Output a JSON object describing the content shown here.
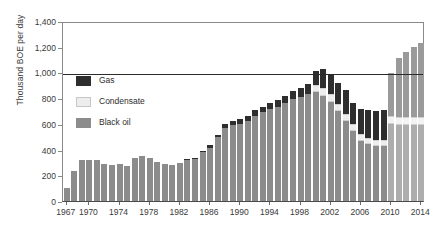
{
  "chart_data": {
    "type": "bar",
    "stacked": true,
    "title": "",
    "xlabel": "",
    "ylabel": "Thousand BOE per day",
    "ylim": [
      0,
      1400
    ],
    "yticks": [
      "0",
      "200",
      "400",
      "600",
      "800",
      "1,000",
      "1,200",
      "1,400"
    ],
    "ytick_values": [
      0,
      200,
      400,
      600,
      800,
      1000,
      1200,
      1400
    ],
    "grid": false,
    "legend_position": "inside-upper-left",
    "reference_line": 1000,
    "categories": [
      1967,
      1968,
      1969,
      1970,
      1971,
      1972,
      1973,
      1974,
      1975,
      1976,
      1977,
      1978,
      1979,
      1980,
      1981,
      1982,
      1983,
      1984,
      1985,
      1986,
      1987,
      1988,
      1989,
      1990,
      1991,
      1992,
      1993,
      1994,
      1995,
      1996,
      1997,
      1998,
      1999,
      2000,
      2001,
      2002,
      2003,
      2004,
      2005,
      2006,
      2007,
      2008,
      2009,
      2010,
      2011,
      2012,
      2013,
      2014
    ],
    "xtick_labels": [
      "1967",
      "1970",
      "1974",
      "1978",
      "1982",
      "1986",
      "1990",
      "1994",
      "1998",
      "2002",
      "2006",
      "2010",
      "2014"
    ],
    "xtick_years": [
      1967,
      1970,
      1974,
      1978,
      1982,
      1986,
      1990,
      1994,
      1998,
      2002,
      2006,
      2010,
      2014
    ],
    "projection_start_year": 2010,
    "series": [
      {
        "name": "Black oil",
        "color": "#8c8c8c",
        "values": [
          98,
          232,
          318,
          320,
          318,
          288,
          278,
          288,
          275,
          335,
          352,
          338,
          303,
          285,
          282,
          295,
          325,
          328,
          378,
          415,
          495,
          570,
          590,
          600,
          625,
          665,
          690,
          712,
          735,
          760,
          790,
          812,
          835,
          850,
          820,
          770,
          700,
          620,
          545,
          470,
          445,
          430,
          425,
          600,
          595,
          590,
          588,
          590
        ]
      },
      {
        "name": "Condensate",
        "color": "#ededed",
        "values": [
          0,
          0,
          0,
          0,
          0,
          0,
          0,
          0,
          0,
          0,
          0,
          0,
          0,
          0,
          0,
          0,
          0,
          0,
          0,
          0,
          0,
          0,
          0,
          0,
          0,
          0,
          0,
          0,
          0,
          0,
          0,
          0,
          0,
          55,
          60,
          60,
          58,
          55,
          52,
          50,
          48,
          48,
          48,
          60,
          62,
          62,
          62,
          62
        ]
      },
      {
        "name": "Gas",
        "color": "#2e2e2e",
        "values": [
          0,
          0,
          0,
          0,
          0,
          0,
          0,
          0,
          0,
          0,
          0,
          0,
          0,
          0,
          0,
          0,
          5,
          8,
          12,
          18,
          22,
          30,
          32,
          35,
          38,
          42,
          45,
          48,
          52,
          58,
          62,
          68,
          78,
          105,
          150,
          155,
          158,
          190,
          168,
          195,
          215,
          220,
          235,
          335,
          455,
          510,
          545,
          580
        ]
      }
    ],
    "totals": [
      98,
      232,
      318,
      320,
      318,
      288,
      278,
      288,
      275,
      335,
      352,
      338,
      303,
      285,
      282,
      295,
      330,
      336,
      390,
      433,
      517,
      600,
      622,
      635,
      663,
      707,
      735,
      760,
      787,
      818,
      852,
      880,
      913,
      1010,
      1030,
      985,
      916,
      865,
      765,
      715,
      708,
      698,
      708,
      995,
      1112,
      1162,
      1195,
      1232
    ]
  },
  "legend": {
    "items": [
      {
        "label": "Gas",
        "swatch": "sw-gas"
      },
      {
        "label": "Condensate",
        "swatch": "sw-cond"
      },
      {
        "label": "Black oil",
        "swatch": "sw-oil"
      }
    ]
  }
}
